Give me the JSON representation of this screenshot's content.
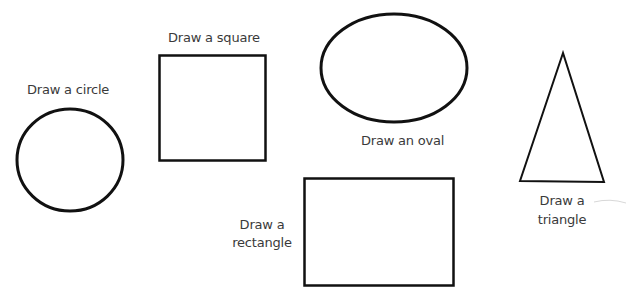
{
  "shapes": {
    "circle": {
      "label": "Draw a circle"
    },
    "square": {
      "label": "Draw a square"
    },
    "oval": {
      "label": "Draw an oval"
    },
    "rectangle": {
      "label_line1": "Draw a",
      "label_line2": "rectangle"
    },
    "triangle": {
      "label_line1": "Draw a",
      "label_line2": "triangle"
    }
  },
  "colors": {
    "stroke": "#111111",
    "text": "#3a3a3a",
    "background": "#ffffff"
  }
}
